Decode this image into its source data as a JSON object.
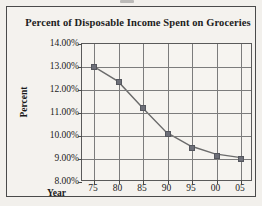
{
  "chart_data": {
    "type": "line",
    "title": "Percent of Disposable Income Spent on Groceries",
    "xlabel": "Year",
    "ylabel": "Percent",
    "categories": [
      "75",
      "80",
      "85",
      "90",
      "95",
      "00",
      "05"
    ],
    "values": [
      13.0,
      12.35,
      11.2,
      10.1,
      9.5,
      9.15,
      9.0
    ],
    "x_tick_labels": [
      "75",
      "80",
      "85",
      "90",
      "95",
      "00",
      "05"
    ],
    "y_tick_labels": [
      "14.00%",
      "13.00%",
      "12.00%",
      "11.00%",
      "10.00%",
      "9.00%",
      "8.00%"
    ],
    "y_tick_values": [
      14,
      13,
      12,
      11,
      10,
      9,
      8
    ],
    "ylim": [
      8,
      14
    ],
    "grid": true,
    "legend": false,
    "marker": "square",
    "series_color": "#6d6f78",
    "line_color": "#6b6b6b",
    "grid_color": "#7c7c7c",
    "axis_color": "#4a4a4a",
    "background_color": "#f4f2ee",
    "text_color": "#1a1a1a"
  }
}
